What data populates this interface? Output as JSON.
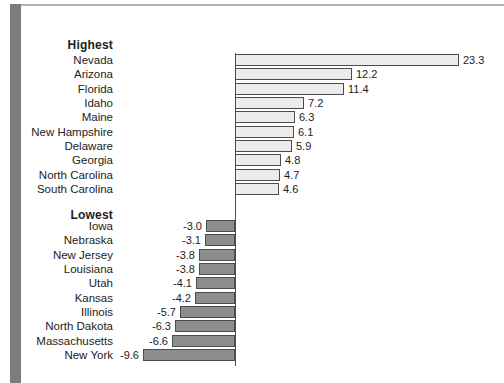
{
  "figure": {
    "background": "#ffffff",
    "text_color": "#222222",
    "decor": {
      "left_stripe_color": "#7c7c7c",
      "top_rule_color": "#b3b3b3"
    }
  },
  "chart_data": {
    "type": "bar",
    "orientation": "horizontal",
    "title": "",
    "xlabel": "",
    "ylabel": "",
    "xlim": [
      -10,
      24
    ],
    "gridlines": false,
    "legend": "none",
    "axis": {
      "zero_line": true,
      "zero_line_color": "#4d4d4d"
    },
    "sections": [
      {
        "label": "Highest",
        "bar_color": "#ececea",
        "bar_border_color": "#4d4d4d",
        "value_label_side": "right",
        "rows": [
          {
            "state": "Nevada",
            "value": 23.3,
            "label": "23.3"
          },
          {
            "state": "Arizona",
            "value": 12.2,
            "label": "12.2"
          },
          {
            "state": "Florida",
            "value": 11.4,
            "label": "11.4"
          },
          {
            "state": "Idaho",
            "value": 7.2,
            "label": "7.2"
          },
          {
            "state": "Maine",
            "value": 6.3,
            "label": "6.3"
          },
          {
            "state": "New Hampshire",
            "value": 6.1,
            "label": "6.1"
          },
          {
            "state": "Delaware",
            "value": 5.9,
            "label": "5.9"
          },
          {
            "state": "Georgia",
            "value": 4.8,
            "label": "4.8"
          },
          {
            "state": "North Carolina",
            "value": 4.7,
            "label": "4.7"
          },
          {
            "state": "South Carolina",
            "value": 4.6,
            "label": "4.6"
          }
        ]
      },
      {
        "label": "Lowest",
        "bar_color": "#8d8d8d",
        "bar_border_color": "#4d4d4d",
        "value_label_side": "left",
        "rows": [
          {
            "state": "Iowa",
            "value": -3.0,
            "label": "-3.0"
          },
          {
            "state": "Nebraska",
            "value": -3.1,
            "label": "-3.1"
          },
          {
            "state": "New Jersey",
            "value": -3.8,
            "label": "-3.8"
          },
          {
            "state": "Louisiana",
            "value": -3.8,
            "label": "-3.8"
          },
          {
            "state": "Utah",
            "value": -4.1,
            "label": "-4.1"
          },
          {
            "state": "Kansas",
            "value": -4.2,
            "label": "-4.2"
          },
          {
            "state": "Illinois",
            "value": -5.7,
            "label": "-5.7"
          },
          {
            "state": "North Dakota",
            "value": -6.3,
            "label": "-6.3"
          },
          {
            "state": "Massachusetts",
            "value": -6.6,
            "label": "-6.6"
          },
          {
            "state": "New York",
            "value": -9.6,
            "label": "-9.6"
          }
        ]
      }
    ]
  }
}
